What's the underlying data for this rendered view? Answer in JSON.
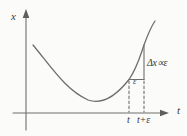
{
  "figure": {
    "y_axis_label": "x",
    "x_axis_label": "t",
    "labels": {
      "delta_annotation": "Δx∝ε",
      "epsilon_annotation": "ε",
      "tick_t": "t",
      "tick_t_plus_epsilon": "t+ε"
    },
    "colors": {
      "background": "#fbfbf9",
      "line": "#6e6e6e",
      "arrow": "#5e5e5e",
      "text": "#3a3a3a"
    }
  }
}
